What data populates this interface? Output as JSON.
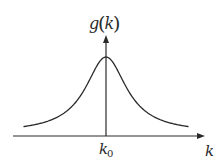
{
  "chart_data": {
    "type": "line",
    "title": "",
    "function": "lorentzian",
    "center_label": "k0",
    "xlabel": "k",
    "ylabel": "g(k)",
    "ylabel_func": "g",
    "ylabel_arg": "k",
    "x_tick_labels": [
      {
        "main": "k",
        "sub": "0"
      }
    ],
    "center": 0,
    "half_width": 1,
    "peak": 1,
    "xlim": [
      -3.3,
      3.3
    ],
    "ylim": [
      0,
      1.3
    ],
    "grid": false,
    "legend": "none",
    "series": [
      {
        "name": "g(k)",
        "color": "#2a2a2a"
      }
    ]
  },
  "colors": {
    "ink": "#2a2a2a",
    "background": "#ffffff"
  }
}
